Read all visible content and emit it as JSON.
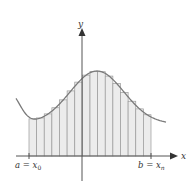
{
  "figure": {
    "type": "riemann-sum-diagram",
    "axes": {
      "x_label": "x",
      "y_label": "y"
    },
    "interval": {
      "left_label_var": "a",
      "left_label_eq": " = ",
      "left_label_x": "x",
      "left_label_sub": "0",
      "right_label_var": "b",
      "right_label_eq": " = ",
      "right_label_x": "x",
      "right_label_sub": "n"
    },
    "subintervals": 16,
    "colors": {
      "curve": "#7a7a7a",
      "strip_fill": "#ececec",
      "strip_line": "#9a9a9a",
      "axis": "#555555"
    }
  }
}
